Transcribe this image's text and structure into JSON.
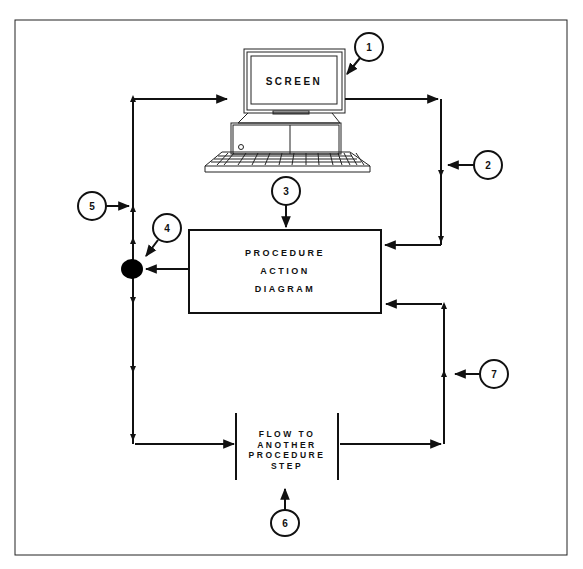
{
  "diagram": {
    "title": "",
    "nodes": {
      "screen": {
        "label": "SCREEN"
      },
      "pad": {
        "lines": [
          "PROCEDURE",
          "ACTION",
          "DIAGRAM"
        ]
      },
      "flow": {
        "lines": [
          "FLOW TO",
          "ANOTHER",
          "PROCEDURE",
          "STEP"
        ]
      }
    },
    "callouts": [
      {
        "id": "1",
        "label": "1"
      },
      {
        "id": "2",
        "label": "2"
      },
      {
        "id": "3",
        "label": "3"
      },
      {
        "id": "4",
        "label": "4"
      },
      {
        "id": "5",
        "label": "5"
      },
      {
        "id": "6",
        "label": "6"
      },
      {
        "id": "7",
        "label": "7"
      }
    ],
    "colors": {
      "line": "#111111",
      "background": "#ffffff",
      "junction": "#000000"
    }
  }
}
